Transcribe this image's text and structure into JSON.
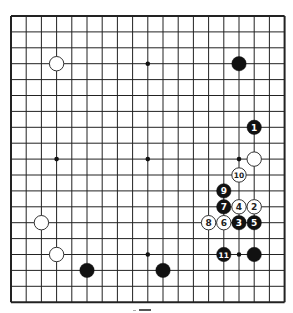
{
  "board": {
    "size": 19,
    "origin_x": 11,
    "origin_y": 16,
    "spacing_x": 15.2,
    "spacing_y": 15.9,
    "stone_radius": 7.2,
    "line_color": "#222222",
    "black_color": "#111111",
    "white_fill": "#ffffff",
    "white_stroke": "#333333",
    "star_points": [
      [
        3,
        3
      ],
      [
        9,
        3
      ],
      [
        15,
        3
      ],
      [
        3,
        9
      ],
      [
        9,
        9
      ],
      [
        15,
        9
      ],
      [
        3,
        15
      ],
      [
        9,
        15
      ],
      [
        15,
        15
      ]
    ],
    "stones": [
      {
        "color": "white",
        "col": 3,
        "row": 3,
        "label": ""
      },
      {
        "color": "black",
        "col": 15,
        "row": 3,
        "label": ""
      },
      {
        "color": "black",
        "col": 16,
        "row": 7,
        "label": "1"
      },
      {
        "color": "white",
        "col": 16,
        "row": 9,
        "label": ""
      },
      {
        "color": "white",
        "col": 15,
        "row": 10,
        "label": "10"
      },
      {
        "color": "black",
        "col": 14,
        "row": 11,
        "label": "9"
      },
      {
        "color": "black",
        "col": 14,
        "row": 12,
        "label": "7"
      },
      {
        "color": "white",
        "col": 15,
        "row": 12,
        "label": "4"
      },
      {
        "color": "white",
        "col": 16,
        "row": 12,
        "label": "2"
      },
      {
        "color": "white",
        "col": 13,
        "row": 13,
        "label": "8"
      },
      {
        "color": "white",
        "col": 14,
        "row": 13,
        "label": "6"
      },
      {
        "color": "black",
        "col": 15,
        "row": 13,
        "label": "3"
      },
      {
        "color": "black",
        "col": 16,
        "row": 13,
        "label": "5"
      },
      {
        "color": "white",
        "col": 2,
        "row": 13,
        "label": ""
      },
      {
        "color": "white",
        "col": 3,
        "row": 15,
        "label": ""
      },
      {
        "color": "black",
        "col": 14,
        "row": 15,
        "label": "11"
      },
      {
        "color": "black",
        "col": 16,
        "row": 15,
        "label": ""
      },
      {
        "color": "black",
        "col": 5,
        "row": 16,
        "label": ""
      },
      {
        "color": "black",
        "col": 10,
        "row": 16,
        "label": ""
      }
    ]
  }
}
